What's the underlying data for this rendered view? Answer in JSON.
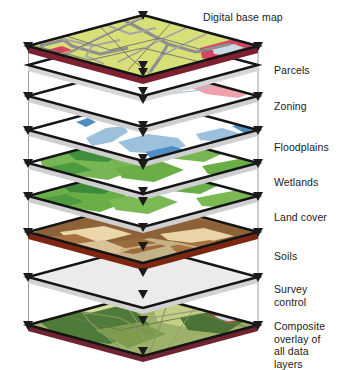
{
  "diagram": {
    "type": "isometric-layer-stack",
    "layer_count": 8,
    "geometry": {
      "plane_half_width": 115,
      "plane_half_height": 31,
      "center_x": 143,
      "edge_thickness": 6,
      "layer_center_y": [
        46,
        96,
        130,
        163,
        196,
        232,
        277,
        325
      ]
    },
    "colors": {
      "base_map_fill": "#d6dd73",
      "base_map_road": "#8f8f8f",
      "base_map_red": "#d6445f",
      "base_map_water": "#c3d6e8",
      "parcels_fill": "#ffffff",
      "parcels_line": "#8a8a8a",
      "zoning_fill": "#ffffff",
      "zoning_pink": "#f0a1ac",
      "zoning_outline": "#9fc0da",
      "floodplain_fill": "#ffffff",
      "floodplain_water": "#9dc0dc",
      "floodplain_water_dark": "#4e8ec4",
      "wetlands_fill": "#ffffff",
      "wetlands_green": "#7fbb56",
      "wetlands_green_dark": "#3f8f3f",
      "landcover_fill": "#ffffff",
      "landcover_green": "#6fae4e",
      "soils_tan": "#cbb98e",
      "soils_brown": "#9c6a3c",
      "soils_rust": "#a84a20",
      "soils_cream": "#ead2a4",
      "survey_fill": "#e9e9e9",
      "composite_green": "#7a9a52",
      "edge_dark": "#1b1b1b",
      "edge_red": "#8d2030",
      "edge_white": "#f2f2f2",
      "guide_line": "#9a9a9a",
      "arrow": "#6e6e6e",
      "label_text": "#1a1a1a"
    },
    "labels": [
      {
        "id": "digital-base-map",
        "text": "Digital base map",
        "x": 203,
        "y": 11
      },
      {
        "id": "parcels",
        "text": "Parcels",
        "x": 274,
        "y": 64
      },
      {
        "id": "zoning",
        "text": "Zoning",
        "x": 274,
        "y": 100
      },
      {
        "id": "floodplains",
        "text": "Floodplains",
        "x": 274,
        "y": 141
      },
      {
        "id": "wetlands",
        "text": "Wetlands",
        "x": 274,
        "y": 176
      },
      {
        "id": "land-cover",
        "text": "Land cover",
        "x": 274,
        "y": 211
      },
      {
        "id": "soils",
        "text": "Soils",
        "x": 274,
        "y": 250
      },
      {
        "id": "survey-control",
        "text": "Survey\ncontrol",
        "x": 274,
        "y": 283
      },
      {
        "id": "composite-overlay",
        "text": "Composite\noverlay of\nall data layers",
        "x": 274,
        "y": 320
      }
    ],
    "layers": [
      {
        "id": "digital-base-map",
        "name": "Digital base map",
        "cy": 46,
        "edge": "#8d2030"
      },
      {
        "id": "parcels",
        "name": "Parcels",
        "cy": 96,
        "edge": "#f2f2f2"
      },
      {
        "id": "zoning",
        "name": "Zoning",
        "cy": 130,
        "edge": "#f2f2f2"
      },
      {
        "id": "floodplains",
        "name": "Floodplains",
        "cy": 163,
        "edge": "#f2f2f2"
      },
      {
        "id": "wetlands",
        "name": "Wetlands",
        "cy": 196,
        "edge": "#f2f2f2"
      },
      {
        "id": "land-cover",
        "name": "Land cover",
        "cy": 232,
        "edge": "#f2f2f2"
      },
      {
        "id": "soils",
        "name": "Soils",
        "cy": 277,
        "edge": "#8d2030"
      },
      {
        "id": "survey-control",
        "name": "Survey control",
        "cy": 325,
        "edge": "#f2f2f2"
      }
    ],
    "connectors": {
      "vertical_guide_x": [
        38,
        248
      ],
      "center_arrow_x": 143,
      "description": "Downward arrows pierce the near and far vertices of each plane"
    }
  }
}
